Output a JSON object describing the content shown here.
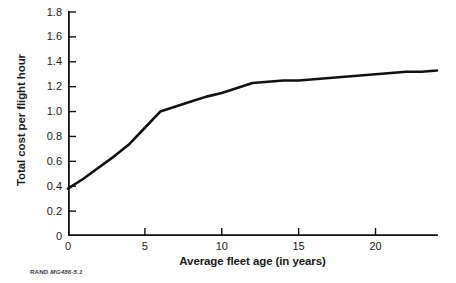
{
  "figure": {
    "source_note_prefix": "RAND",
    "source_note_id": "MG486-5.1"
  },
  "chart_data": {
    "type": "line",
    "title": "",
    "subtitle": "",
    "xlabel": "Average fleet age (in years)",
    "ylabel": "Total cost per flight hour",
    "xlim": [
      0,
      24
    ],
    "ylim": [
      0,
      1.8
    ],
    "grid": false,
    "legend": null,
    "xticks": [
      0,
      5,
      10,
      15,
      20
    ],
    "xtick_labels": [
      "0",
      "5",
      "10",
      "15",
      "20"
    ],
    "yticks": [
      0,
      0.2,
      0.4,
      0.6,
      0.8,
      1.0,
      1.2,
      1.4,
      1.6,
      1.8
    ],
    "ytick_labels": [
      "0",
      "0.2",
      "0.4",
      "0.6",
      "0.8",
      "1.0",
      "1.2",
      "1.4",
      "1.6",
      "1.8"
    ],
    "line_color": "#111111",
    "line_width": 2.6,
    "series": [
      {
        "name": "Total cost per flight hour",
        "x": [
          0,
          1,
          2,
          3,
          4,
          5,
          6,
          7,
          8,
          9,
          10,
          11,
          12,
          13,
          14,
          15,
          16,
          17,
          18,
          19,
          20,
          21,
          22,
          23,
          24
        ],
        "y": [
          0.38,
          0.46,
          0.55,
          0.64,
          0.74,
          0.87,
          1.0,
          1.04,
          1.08,
          1.12,
          1.15,
          1.19,
          1.23,
          1.24,
          1.25,
          1.25,
          1.26,
          1.27,
          1.28,
          1.29,
          1.3,
          1.31,
          1.32,
          1.32,
          1.33
        ]
      }
    ]
  }
}
